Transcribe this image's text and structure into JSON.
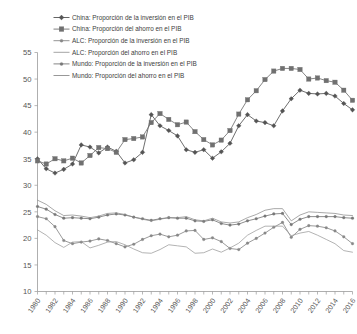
{
  "chart_data": {
    "type": "line",
    "title": "",
    "subtitle": "",
    "xlabel": "",
    "ylabel": "",
    "xlim": [
      1980,
      2016
    ],
    "ylim": [
      10,
      55
    ],
    "yticks": [
      10,
      15,
      20,
      25,
      30,
      35,
      40,
      45,
      50,
      55
    ],
    "grid": false,
    "legend_position": "top-left",
    "x": [
      1980,
      1981,
      1982,
      1983,
      1984,
      1985,
      1986,
      1987,
      1988,
      1989,
      1990,
      1991,
      1992,
      1993,
      1994,
      1995,
      1996,
      1997,
      1998,
      1999,
      2000,
      2001,
      2002,
      2003,
      2004,
      2005,
      2006,
      2007,
      2008,
      2009,
      2010,
      2011,
      2012,
      2013,
      2014,
      2015,
      2016
    ],
    "xticks": [
      1980,
      1982,
      1984,
      1986,
      1988,
      1990,
      1992,
      1994,
      1996,
      1998,
      2000,
      2002,
      2004,
      2006,
      2008,
      2010,
      2012,
      2014,
      2016
    ],
    "series": [
      {
        "name": "China: Proporción de la inversión en el PIB",
        "marker": "diamond",
        "color": "#545454",
        "dash": "none",
        "values": [
          35.0,
          33.1,
          32.3,
          33.0,
          34.0,
          37.6,
          37.2,
          36.1,
          37.2,
          36.4,
          34.2,
          34.8,
          36.2,
          43.3,
          41.2,
          40.3,
          39.3,
          36.7,
          36.2,
          36.7,
          35.1,
          36.3,
          37.9,
          41.2,
          43.3,
          42.1,
          41.8,
          41.2,
          44.0,
          46.3,
          47.9,
          47.3,
          47.2,
          47.3,
          46.8,
          45.4,
          44.2
        ]
      },
      {
        "name": "China: Proporción del ahorro en el PIB",
        "marker": "square",
        "color": "#707070",
        "dash": "none",
        "values": [
          34.6,
          34.0,
          35.0,
          34.6,
          35.1,
          34.2,
          35.6,
          37.1,
          36.9,
          36.2,
          38.6,
          38.8,
          39.1,
          41.8,
          43.5,
          42.4,
          41.4,
          41.9,
          40.1,
          38.6,
          37.6,
          38.5,
          40.3,
          43.4,
          46.1,
          47.8,
          49.9,
          51.5,
          52.0,
          52.0,
          51.8,
          50.0,
          50.2,
          49.7,
          49.4,
          47.9,
          46.0
        ]
      },
      {
        "name": "ALC: Proporción de la inversión en el PIB",
        "marker": "dot",
        "color": "#888888",
        "dash": "none",
        "values": [
          24.1,
          23.7,
          22.2,
          19.6,
          19.0,
          19.3,
          19.5,
          19.9,
          19.6,
          19.0,
          18.4,
          18.9,
          19.8,
          20.5,
          20.8,
          20.3,
          20.6,
          21.4,
          21.5,
          19.8,
          20.1,
          19.4,
          18.1,
          17.9,
          19.1,
          20.0,
          21.0,
          22.1,
          23.0,
          20.2,
          21.7,
          22.4,
          22.3,
          22.0,
          21.4,
          20.3,
          19.0
        ]
      },
      {
        "name": "ALC: Proporción del ahorro en el PIB",
        "marker": "none",
        "color": "#9a9a9a",
        "dash": "none",
        "values": [
          21.6,
          20.6,
          19.2,
          18.3,
          19.3,
          19.4,
          18.2,
          18.7,
          19.3,
          19.4,
          18.8,
          18.0,
          17.3,
          17.2,
          17.9,
          18.8,
          18.6,
          18.4,
          17.2,
          17.3,
          18.0,
          17.4,
          18.2,
          19.1,
          20.6,
          21.5,
          22.3,
          22.3,
          22.3,
          20.5,
          21.0,
          21.3,
          20.6,
          19.8,
          19.0,
          17.7,
          17.4
        ]
      },
      {
        "name": "Mundo: Proporción de la inversión en el PIB",
        "marker": "dot",
        "color": "#787878",
        "dash": "none",
        "values": [
          26.0,
          25.5,
          24.5,
          23.8,
          23.9,
          23.8,
          23.7,
          24.0,
          24.4,
          24.6,
          24.4,
          24.0,
          23.7,
          23.4,
          23.7,
          23.9,
          23.8,
          23.8,
          23.3,
          23.2,
          23.5,
          22.8,
          22.5,
          22.7,
          23.3,
          23.7,
          24.2,
          24.6,
          24.7,
          22.6,
          23.6,
          24.1,
          24.1,
          24.1,
          24.1,
          23.9,
          23.8
        ]
      },
      {
        "name": "Mundo: Proporción del ahorro en el PIB",
        "marker": "none",
        "color": "#8c8c8c",
        "dash": "none",
        "values": [
          27.2,
          26.4,
          25.2,
          24.3,
          24.4,
          24.2,
          23.9,
          24.2,
          24.7,
          24.8,
          24.5,
          24.0,
          23.6,
          23.3,
          23.6,
          23.9,
          23.9,
          24.1,
          23.5,
          23.3,
          23.8,
          23.1,
          22.9,
          23.1,
          23.9,
          24.5,
          25.3,
          25.6,
          25.6,
          23.3,
          24.4,
          25.0,
          24.9,
          24.8,
          24.7,
          24.4,
          24.3
        ]
      }
    ]
  },
  "legend": {
    "items": [
      {
        "label": "China: Proporción de la inversión en el PIB",
        "marker": "diamond"
      },
      {
        "label": "China: Proporción del ahorro en el PIB",
        "marker": "square"
      },
      {
        "label": "ALC: Proporción de la inversión en el PIB",
        "marker": "dot"
      },
      {
        "label": "ALC: Proporción del ahorro en el PIB",
        "marker": "none"
      },
      {
        "label": "Mundo: Proporción de la inversión en el PIB",
        "marker": "dot"
      },
      {
        "label": "Mundo: Proporción del ahorro en el PIB",
        "marker": "none"
      }
    ]
  },
  "axes": {
    "y_tick_labels": [
      "55",
      "50",
      "45",
      "40",
      "35",
      "30",
      "25",
      "20",
      "15",
      "10"
    ],
    "x_tick_labels": [
      "1980",
      "1982",
      "1984",
      "1986",
      "1988",
      "1990",
      "1992",
      "1994",
      "1996",
      "1998",
      "2000",
      "2002",
      "2004",
      "2006",
      "2008",
      "2010",
      "2012",
      "2014",
      "2016"
    ]
  },
  "colors": {
    "axis": "#9a9a9a",
    "text": "#555555",
    "china_investment": "#545454",
    "china_savings": "#707070",
    "alc_investment": "#888888",
    "alc_savings": "#9a9a9a",
    "world_investment": "#787878",
    "world_savings": "#8c8c8c"
  }
}
